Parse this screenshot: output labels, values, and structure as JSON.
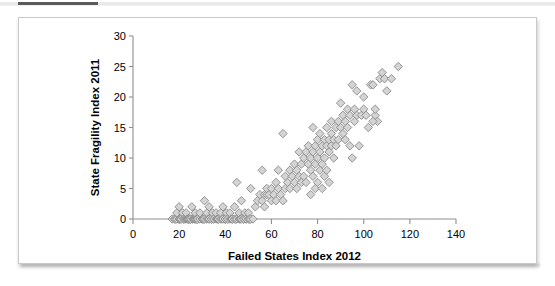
{
  "figure": {
    "background_color": "#ffffff",
    "border_color": "#c9c9c9",
    "top_rule_color": "#5a5a5a"
  },
  "chart_data": {
    "type": "scatter",
    "title": "",
    "xlabel": "Failed States Index 2012",
    "ylabel": "State Fragility Index 2011",
    "xlim": [
      0,
      140
    ],
    "ylim": [
      0,
      30
    ],
    "xticks": [
      0,
      20,
      40,
      60,
      80,
      100,
      120,
      140
    ],
    "yticks": [
      0,
      5,
      10,
      15,
      20,
      25,
      30
    ],
    "xtick_labels": [
      "0",
      "20",
      "40",
      "60",
      "80",
      "100",
      "120",
      "140"
    ],
    "ytick_labels": [
      "0",
      "5",
      "10",
      "15",
      "20",
      "25",
      "30"
    ],
    "grid": false,
    "legend": false,
    "marker": {
      "shape": "diamond",
      "fill_color": "#d4d4d4",
      "edge_color": "#8a8a8a",
      "size_px": 6
    },
    "n_points": 182,
    "points": [
      [
        17,
        0
      ],
      [
        18,
        0
      ],
      [
        18.5,
        0
      ],
      [
        19,
        0
      ],
      [
        19,
        1
      ],
      [
        20,
        0
      ],
      [
        20,
        2
      ],
      [
        20.5,
        0
      ],
      [
        21,
        0
      ],
      [
        21.5,
        1
      ],
      [
        22,
        0
      ],
      [
        22,
        0
      ],
      [
        22.5,
        0
      ],
      [
        23,
        0
      ],
      [
        23,
        1
      ],
      [
        23.5,
        0
      ],
      [
        24,
        0
      ],
      [
        24,
        0
      ],
      [
        24.5,
        0
      ],
      [
        25,
        0
      ],
      [
        25,
        0
      ],
      [
        25.5,
        2
      ],
      [
        26,
        0
      ],
      [
        26,
        0
      ],
      [
        26.5,
        0
      ],
      [
        27,
        0
      ],
      [
        27,
        1
      ],
      [
        27.5,
        0
      ],
      [
        28,
        0
      ],
      [
        28,
        0
      ],
      [
        29,
        0
      ],
      [
        29,
        1
      ],
      [
        30,
        0
      ],
      [
        30,
        0
      ],
      [
        30.5,
        0
      ],
      [
        31,
        0
      ],
      [
        31,
        3
      ],
      [
        32,
        0
      ],
      [
        32,
        1
      ],
      [
        32.5,
        0
      ],
      [
        33,
        0
      ],
      [
        33,
        2
      ],
      [
        34,
        0
      ],
      [
        34,
        0
      ],
      [
        34.5,
        1
      ],
      [
        35,
        0
      ],
      [
        35,
        0
      ],
      [
        36,
        0
      ],
      [
        36,
        1
      ],
      [
        36.5,
        0
      ],
      [
        37,
        0
      ],
      [
        37,
        0
      ],
      [
        38,
        0
      ],
      [
        38,
        1
      ],
      [
        38.5,
        0
      ],
      [
        39,
        0
      ],
      [
        39,
        2
      ],
      [
        40,
        0
      ],
      [
        40,
        0
      ],
      [
        40.5,
        1
      ],
      [
        41,
        0
      ],
      [
        41,
        0
      ],
      [
        42,
        0
      ],
      [
        42,
        1
      ],
      [
        42.5,
        0
      ],
      [
        43,
        0
      ],
      [
        43,
        0
      ],
      [
        44,
        0
      ],
      [
        44,
        2
      ],
      [
        44.5,
        0
      ],
      [
        45,
        0
      ],
      [
        45,
        6
      ],
      [
        46,
        0
      ],
      [
        46,
        1
      ],
      [
        46.5,
        0
      ],
      [
        47,
        0
      ],
      [
        47,
        3
      ],
      [
        48,
        0
      ],
      [
        48,
        0
      ],
      [
        48.5,
        1
      ],
      [
        49,
        0
      ],
      [
        49,
        0
      ],
      [
        50,
        0
      ],
      [
        50,
        1
      ],
      [
        50.5,
        0
      ],
      [
        51,
        0
      ],
      [
        51,
        5
      ],
      [
        52,
        0
      ],
      [
        53,
        2
      ],
      [
        54,
        3
      ],
      [
        55,
        4
      ],
      [
        56,
        3
      ],
      [
        56,
        8
      ],
      [
        57,
        4
      ],
      [
        57,
        2
      ],
      [
        58,
        4
      ],
      [
        58,
        5
      ],
      [
        59,
        4
      ],
      [
        60,
        3
      ],
      [
        60,
        5
      ],
      [
        61,
        4
      ],
      [
        62,
        6
      ],
      [
        62,
        3
      ],
      [
        63,
        5
      ],
      [
        63,
        8
      ],
      [
        64,
        4
      ],
      [
        65,
        3
      ],
      [
        65,
        14
      ],
      [
        66,
        5
      ],
      [
        66,
        7
      ],
      [
        67,
        6
      ],
      [
        68,
        5
      ],
      [
        68,
        8
      ],
      [
        69,
        7
      ],
      [
        70,
        6
      ],
      [
        70,
        9
      ],
      [
        71,
        8
      ],
      [
        71,
        5
      ],
      [
        72,
        7
      ],
      [
        72,
        11
      ],
      [
        73,
        6
      ],
      [
        73,
        9
      ],
      [
        74,
        10
      ],
      [
        74,
        7
      ],
      [
        75,
        6
      ],
      [
        75,
        11
      ],
      [
        76,
        9
      ],
      [
        76,
        12
      ],
      [
        77,
        8
      ],
      [
        77,
        10
      ],
      [
        77,
        4
      ],
      [
        78,
        11
      ],
      [
        78,
        7
      ],
      [
        78,
        15
      ],
      [
        79,
        9
      ],
      [
        79,
        12
      ],
      [
        79,
        5
      ],
      [
        80,
        10
      ],
      [
        80,
        13
      ],
      [
        80,
        6
      ],
      [
        81,
        11
      ],
      [
        81,
        8
      ],
      [
        81,
        14
      ],
      [
        82,
        12
      ],
      [
        82,
        9
      ],
      [
        82,
        5
      ],
      [
        83,
        13
      ],
      [
        83,
        10
      ],
      [
        83,
        7
      ],
      [
        84,
        12
      ],
      [
        84,
        15
      ],
      [
        84,
        8
      ],
      [
        85,
        11
      ],
      [
        85,
        13
      ],
      [
        85,
        6
      ],
      [
        86,
        14
      ],
      [
        86,
        12
      ],
      [
        86,
        16
      ],
      [
        87,
        13
      ],
      [
        87,
        10
      ],
      [
        88,
        15
      ],
      [
        88,
        12
      ],
      [
        89,
        16
      ],
      [
        89,
        13
      ],
      [
        90,
        19
      ],
      [
        90,
        15
      ],
      [
        91,
        14
      ],
      [
        91,
        17
      ],
      [
        92,
        16
      ],
      [
        92,
        13
      ],
      [
        93,
        18
      ],
      [
        93,
        15
      ],
      [
        94,
        17
      ],
      [
        94,
        12
      ],
      [
        95,
        22
      ],
      [
        95,
        10
      ],
      [
        96,
        18
      ],
      [
        96,
        16
      ],
      [
        97,
        21
      ],
      [
        97,
        17
      ],
      [
        98,
        12
      ],
      [
        99,
        17
      ],
      [
        100,
        20
      ],
      [
        100,
        18
      ],
      [
        101,
        17
      ],
      [
        102,
        15
      ],
      [
        103,
        22
      ],
      [
        104,
        22
      ],
      [
        105,
        17
      ],
      [
        105,
        18
      ],
      [
        106,
        16
      ],
      [
        107,
        23
      ],
      [
        108,
        24
      ],
      [
        109,
        23
      ],
      [
        110,
        21
      ],
      [
        112,
        23
      ],
      [
        115,
        25
      ],
      [
        104,
        16
      ]
    ]
  }
}
